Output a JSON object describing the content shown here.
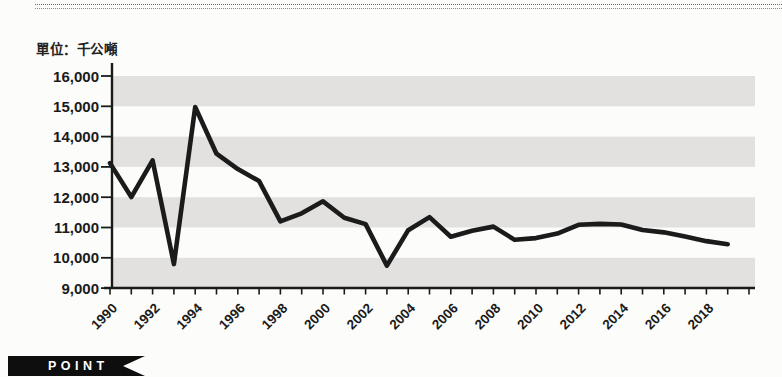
{
  "page": {
    "unit_label": "單位：千公噸"
  },
  "footer": {
    "point_label": "POINT"
  },
  "chart_data": {
    "type": "line",
    "title": "",
    "unit_label": "單位：千公噸",
    "x": [
      1990,
      1991,
      1992,
      1993,
      1994,
      1995,
      1996,
      1997,
      1998,
      1999,
      2000,
      2001,
      2002,
      2003,
      2004,
      2005,
      2006,
      2007,
      2008,
      2009,
      2010,
      2011,
      2012,
      2013,
      2014,
      2015,
      2016,
      2017,
      2018,
      2019
    ],
    "values": [
      13124,
      12005,
      13216,
      9793,
      14976,
      13435,
      12930,
      12531,
      11200,
      11469,
      11863,
      11320,
      11111,
      9740,
      10912,
      11342,
      10695,
      10893,
      11029,
      10593,
      10650,
      10800,
      11090,
      11120,
      11100,
      10920,
      10840,
      10700,
      10550,
      10450
    ],
    "x_tick_labels": [
      "1990",
      "1992",
      "1994",
      "1996",
      "1998",
      "2000",
      "2002",
      "2004",
      "2006",
      "2008",
      "2010",
      "2012",
      "2014",
      "2016",
      "2018"
    ],
    "y_tick_labels": [
      "16,000",
      "15,000",
      "14,000",
      "13,000",
      "12,000",
      "11,000",
      "10,000",
      "9,000"
    ],
    "ylim": [
      9000,
      16000
    ],
    "y_tick_step": 1000,
    "x_axis_tick_years": [
      1990,
      2020
    ],
    "legend": "none",
    "grid": "alternating-horizontal-bands",
    "line_color": "#1b1b1b",
    "band_color": "#e2e1df",
    "axis_color": "#1a1a1a",
    "text_color": "#1a1a1a"
  }
}
